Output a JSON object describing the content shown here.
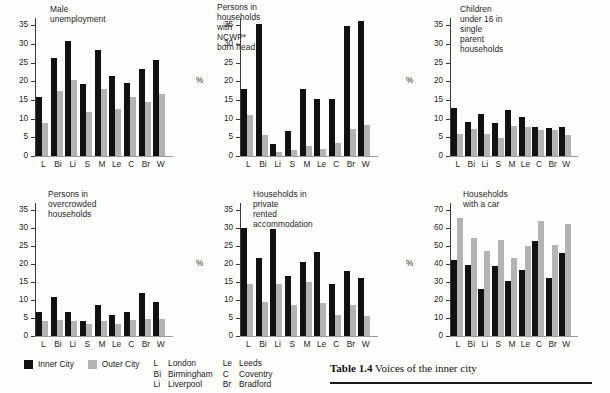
{
  "legend": {
    "series": [
      {
        "name": "inner",
        "label": "Inner City",
        "color": "#111111"
      },
      {
        "name": "outer",
        "label": "Outer City",
        "color": "#b3b3b3"
      }
    ],
    "abbreviations": [
      {
        "key": "L",
        "name": "London"
      },
      {
        "key": "Bi",
        "name": "Birmingham"
      },
      {
        "key": "Li",
        "name": "Liverpool"
      },
      {
        "key": "Le",
        "name": "Leeds"
      },
      {
        "key": "C",
        "name": "Coventry"
      },
      {
        "key": "Br",
        "name": "Bradford"
      }
    ]
  },
  "caption": {
    "number": "Table 1.4",
    "text": "Voices of the inner city"
  },
  "chart_data": [
    {
      "id": "male-unemployment",
      "type": "bar",
      "title": "Male unemployment",
      "ylabel": "%",
      "xlabel": "",
      "categories": [
        "L",
        "Bi",
        "Li",
        "S",
        "M",
        "Le",
        "C",
        "Br",
        "W"
      ],
      "ylim": [
        0,
        37
      ],
      "yticks": [
        0,
        5,
        10,
        15,
        20,
        25,
        30,
        35
      ],
      "grid": false,
      "series": [
        {
          "name": "Inner City",
          "values": [
            15.8,
            26.3,
            30.9,
            19.2,
            28.3,
            21.5,
            19.5,
            23.2,
            25.7
          ]
        },
        {
          "name": "Outer City",
          "values": [
            8.9,
            17.3,
            20.4,
            11.9,
            18.1,
            12.5,
            15.8,
            14.5,
            16.7
          ]
        }
      ]
    },
    {
      "id": "ncwp-born-head",
      "type": "bar",
      "title": "Persons in households with NCWP* born head",
      "ylabel": "%",
      "xlabel": "",
      "categories": [
        "L",
        "Bi",
        "Li",
        "S",
        "M",
        "Le",
        "C",
        "Br",
        "W"
      ],
      "ylim": [
        0,
        37
      ],
      "yticks": [
        0,
        5,
        10,
        15,
        20,
        25,
        30,
        35
      ],
      "grid": false,
      "series": [
        {
          "name": "Inner City",
          "values": [
            18.1,
            35.3,
            3.2,
            6.6,
            18.1,
            15.4,
            15.4,
            34.8,
            36.2
          ]
        },
        {
          "name": "Outer City",
          "values": [
            11.0,
            5.7,
            1.1,
            1.7,
            2.7,
            2.0,
            3.5,
            7.3,
            8.2
          ]
        }
      ]
    },
    {
      "id": "children-single-parent",
      "type": "bar",
      "title": "Children under 16 in single\nparent households",
      "ylabel": "%",
      "xlabel": "",
      "categories": [
        "L",
        "Bi",
        "Li",
        "S",
        "M",
        "Le",
        "C",
        "Br",
        "W"
      ],
      "ylim": [
        0,
        37
      ],
      "yticks": [
        0,
        5,
        10,
        15,
        20,
        25,
        30,
        35
      ],
      "grid": false,
      "series": [
        {
          "name": "Inner City",
          "values": [
            12.9,
            9.1,
            11.3,
            8.9,
            12.4,
            10.5,
            7.9,
            7.6,
            7.8
          ]
        },
        {
          "name": "Outer City",
          "values": [
            6.0,
            7.2,
            6.0,
            4.8,
            8.0,
            7.7,
            6.9,
            7.0,
            5.7
          ]
        }
      ]
    },
    {
      "id": "overcrowded-households",
      "type": "bar",
      "title": "Persons in overcrowded\nhouseholds",
      "ylabel": "%",
      "xlabel": "",
      "categories": [
        "L",
        "Bi",
        "Li",
        "S",
        "M",
        "Le",
        "C",
        "Br",
        "W"
      ],
      "ylim": [
        0,
        37
      ],
      "yticks": [
        0,
        5,
        10,
        15,
        20,
        25,
        30,
        35
      ],
      "grid": false,
      "series": [
        {
          "name": "Inner City",
          "values": [
            6.8,
            10.9,
            6.6,
            4.3,
            8.5,
            5.9,
            6.7,
            12.1,
            9.6
          ]
        },
        {
          "name": "Outer City",
          "values": [
            4.3,
            4.5,
            4.1,
            3.4,
            4.1,
            3.4,
            4.5,
            4.6,
            4.8
          ]
        }
      ]
    },
    {
      "id": "private-rented",
      "type": "bar",
      "title": "Households in private\nrented accommodation",
      "ylabel": "%",
      "xlabel": "",
      "categories": [
        "L",
        "Bi",
        "Li",
        "S",
        "M",
        "Le",
        "C",
        "Br",
        "W"
      ],
      "ylim": [
        0,
        37
      ],
      "yticks": [
        0,
        5,
        10,
        15,
        20,
        25,
        30,
        35
      ],
      "grid": false,
      "series": [
        {
          "name": "Inner City",
          "values": [
            30.0,
            21.7,
            29.8,
            16.7,
            20.7,
            23.5,
            14.4,
            18.2,
            16.1
          ]
        },
        {
          "name": "Outer City",
          "values": [
            14.6,
            9.5,
            14.5,
            8.5,
            14.9,
            9.2,
            5.9,
            8.5,
            5.5
          ]
        }
      ]
    },
    {
      "id": "households-with-car",
      "type": "bar",
      "title": "Households with a car",
      "ylabel": "%",
      "xlabel": "",
      "categories": [
        "L",
        "Bi",
        "Li",
        "S",
        "M",
        "Le",
        "C",
        "Br",
        "W"
      ],
      "ylim": [
        0,
        74
      ],
      "yticks": [
        0,
        10,
        20,
        30,
        40,
        50,
        60,
        70
      ],
      "grid": false,
      "series": [
        {
          "name": "Inner City",
          "values": [
            42.2,
            39.7,
            26.4,
            39.0,
            30.6,
            36.7,
            52.7,
            32.4,
            46.2
          ]
        },
        {
          "name": "Outer City",
          "values": [
            65.8,
            54.3,
            47.3,
            53.3,
            43.3,
            50.0,
            63.8,
            50.8,
            62.4
          ]
        }
      ]
    }
  ]
}
